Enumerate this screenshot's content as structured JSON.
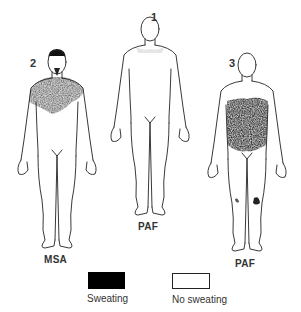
{
  "figures": [
    {
      "number": "1",
      "caption": "PAF",
      "sweating_region": "none (faint residual on shoulders)"
    },
    {
      "number": "2",
      "caption": "MSA",
      "sweating_region": "head, face and upper chest"
    },
    {
      "number": "3",
      "caption": "PAF",
      "sweating_region": "trunk / abdomen, small patches on knees"
    }
  ],
  "legend": {
    "sweating": {
      "label": "Sweating",
      "color": "#000000"
    },
    "no_sweating": {
      "label": "No sweating",
      "color": "#ffffff"
    }
  }
}
